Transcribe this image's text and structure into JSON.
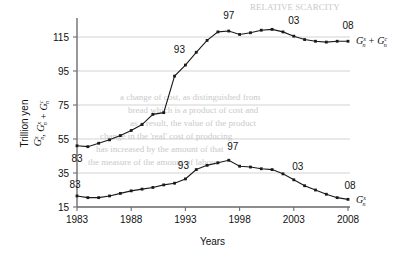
{
  "chart_data": {
    "type": "line",
    "title": "",
    "xlabel": "Years",
    "ylabel_line1": "Trillion yen",
    "ylabel_line2": "Gⁿₓ, Gₓ + Gᶜ",
    "ylabel_parts": {
      "plain": "Trillion yen",
      "term1": {
        "base": "G",
        "sup": "x",
        "sub": "n"
      },
      "separator": ", ",
      "term2": {
        "base": "G",
        "sup": "x",
        "sub": "n"
      },
      "plus": " + ",
      "term3": {
        "base": "G",
        "sup": "c",
        "sub": "n"
      }
    },
    "xlim": [
      1983,
      2008
    ],
    "ylim": [
      15,
      125
    ],
    "xticks": [
      1983,
      1988,
      1993,
      1998,
      2003,
      2008
    ],
    "xtick_labels": [
      "1983",
      "1988",
      "1993",
      "1998",
      "2003",
      "2008"
    ],
    "yticks": [
      15,
      35,
      55,
      75,
      95,
      115
    ],
    "ytick_labels": [
      "15",
      "35",
      "55",
      "75",
      "95",
      "115"
    ],
    "grid": "horizontal",
    "legend_position": "right-inline",
    "x": [
      1983,
      1984,
      1985,
      1986,
      1987,
      1988,
      1989,
      1990,
      1991,
      1992,
      1993,
      1994,
      1995,
      1996,
      1997,
      1998,
      1999,
      2000,
      2001,
      2002,
      2003,
      2004,
      2005,
      2006,
      2007,
      2008
    ],
    "series": [
      {
        "name": "Gx_n + Gc_n",
        "label_parts": [
          {
            "base": "G",
            "sup": "x",
            "sub": "n"
          },
          {
            "plus": " + "
          },
          {
            "base": "G",
            "sup": "c",
            "sub": "n"
          }
        ],
        "values": [
          51.0,
          50.5,
          52.5,
          54.5,
          57.0,
          60.0,
          63.5,
          69.5,
          70.5,
          92.0,
          98.5,
          106.0,
          113.0,
          118.0,
          118.5,
          116.5,
          117.5,
          119.0,
          119.5,
          118.0,
          115.5,
          113.5,
          112.5,
          112.0,
          112.5,
          112.5
        ],
        "annotations": [
          {
            "label": "83",
            "x": 1983,
            "y": 51.0
          },
          {
            "label": "93",
            "x": 1993,
            "y": 98.5
          },
          {
            "label": "97",
            "x": 1997,
            "y": 118.5
          },
          {
            "label": "03",
            "x": 2003,
            "y": 115.5
          },
          {
            "label": "08",
            "x": 2008,
            "y": 112.5
          }
        ]
      },
      {
        "name": "Gx_n",
        "label_parts": [
          {
            "base": "G",
            "sup": "x",
            "sub": "n"
          }
        ],
        "values": [
          21.5,
          20.5,
          20.5,
          21.5,
          23.0,
          24.5,
          25.5,
          26.5,
          28.0,
          29.0,
          31.5,
          37.0,
          39.5,
          41.0,
          42.5,
          39.0,
          38.5,
          37.5,
          37.0,
          34.5,
          31.0,
          27.5,
          25.0,
          22.5,
          20.5,
          19.5
        ],
        "annotations": [
          {
            "label": "83",
            "x": 1983,
            "y": 21.5
          },
          {
            "label": "93",
            "x": 1993,
            "y": 31.5
          },
          {
            "label": "97",
            "x": 1997,
            "y": 42.5
          },
          {
            "label": "03",
            "x": 2003,
            "y": 31.0
          },
          {
            "label": "08",
            "x": 2008,
            "y": 19.5
          }
        ]
      }
    ],
    "colors": {
      "line": "#1a1a1a",
      "marker": "#1a1a1a",
      "grid": "#c0c0c0",
      "axis": "#6e6e6e",
      "background": "#ffffff"
    }
  },
  "bleed_text": [
    {
      "text": "RELATIVE SCARCITY",
      "x": 250,
      "y": 2
    },
    {
      "text": "a change of cost, as distinguished from",
      "x": 120,
      "y": 92
    },
    {
      "text": "bread which is a product of cost and",
      "x": 128,
      "y": 105
    },
    {
      "text": "as a result, the value of the product",
      "x": 130,
      "y": 118
    },
    {
      "text": "change in the 'real' cost of producing",
      "x": 100,
      "y": 131
    },
    {
      "text": "has increased by the amount of that",
      "x": 96,
      "y": 144
    },
    {
      "text": "the measure of the amount of labour",
      "x": 88,
      "y": 157
    }
  ]
}
